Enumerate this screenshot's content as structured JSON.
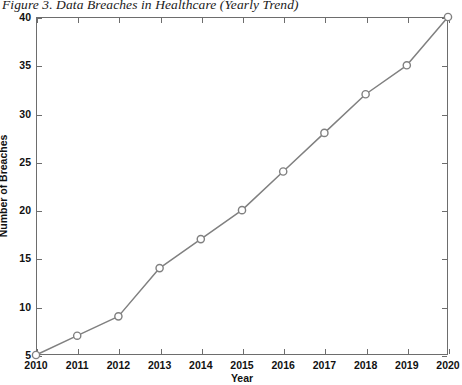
{
  "figure": {
    "caption": "Figure 3. Data Breaches in Healthcare (Yearly Trend)"
  },
  "colors": {
    "line": "#808080",
    "marker_stroke": "#808080",
    "marker_fill": "#ffffff",
    "axis": "#6d6d6d",
    "text": "#111111",
    "background": "#ffffff"
  },
  "chart_data": {
    "type": "line",
    "title": "Figure 3. Data Breaches in Healthcare (Yearly Trend)",
    "xlabel": "Year",
    "ylabel": "Number of Breaches",
    "x": [
      2010,
      2011,
      2012,
      2013,
      2014,
      2015,
      2016,
      2017,
      2018,
      2019,
      2020
    ],
    "values": [
      5,
      7,
      9,
      14,
      17,
      20,
      24,
      28,
      32,
      35,
      40
    ],
    "series": [
      {
        "name": "Number of Breaches",
        "values": [
          5,
          7,
          9,
          14,
          17,
          20,
          24,
          28,
          32,
          35,
          40
        ]
      }
    ],
    "xtick_labels": [
      "2010",
      "2011",
      "2012",
      "2013",
      "2014",
      "2015",
      "2016",
      "2017",
      "2018",
      "2019",
      "2020"
    ],
    "ytick_labels": [
      "5",
      "10",
      "15",
      "20",
      "25",
      "30",
      "35",
      "40"
    ],
    "ytick_values": [
      5,
      10,
      15,
      20,
      25,
      30,
      35,
      40
    ],
    "xlim": [
      2010,
      2020
    ],
    "ylim": [
      5,
      40
    ],
    "grid": false,
    "legend": false,
    "marker": "circle",
    "line_style": "solid"
  }
}
